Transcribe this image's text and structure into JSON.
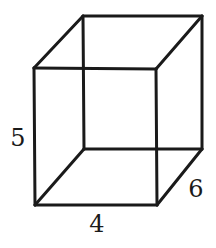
{
  "diagram": {
    "type": "rectangular-prism-wireframe",
    "vertices": {
      "front_top_left": [
        34,
        68
      ],
      "front_top_right": [
        156,
        69
      ],
      "front_bottom_left": [
        35,
        205
      ],
      "front_bottom_right": [
        157,
        205
      ],
      "back_top_left": [
        83,
        16
      ],
      "back_top_right": [
        202,
        16
      ],
      "back_bottom_left": [
        84,
        149
      ],
      "back_bottom_right": [
        202,
        149
      ]
    },
    "labels": {
      "height": "5",
      "width": "4",
      "depth": "6"
    }
  }
}
